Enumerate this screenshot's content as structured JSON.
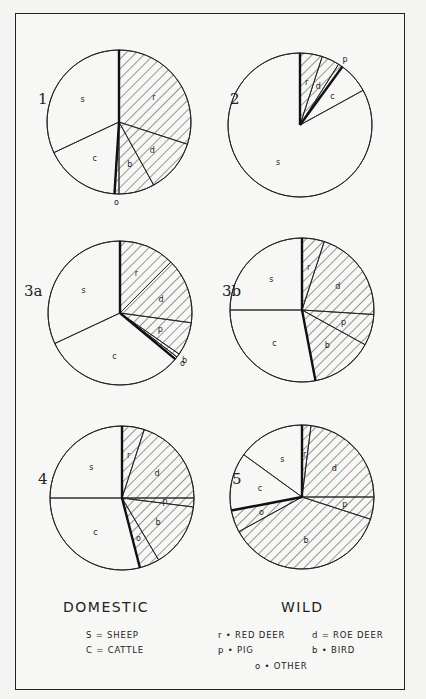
{
  "colors": {
    "ink": "#222222",
    "paper": "#f7f7f5",
    "hatch": "#333333"
  },
  "legend": {
    "domestic_title": "DOMESTIC",
    "wild_title": "WILD",
    "domestic_items": [
      {
        "key": "S",
        "sep": "=",
        "label": "SHEEP"
      },
      {
        "key": "C",
        "sep": "=",
        "label": "CATTLE"
      }
    ],
    "wild_items": [
      {
        "key": "r",
        "sep": "•",
        "label": "RED DEER"
      },
      {
        "key": "d",
        "sep": "=",
        "label": "ROE DEER"
      },
      {
        "key": "p",
        "sep": "•",
        "label": "PIG"
      },
      {
        "key": "b",
        "sep": "•",
        "label": "BIRD"
      },
      {
        "key": "o",
        "sep": "•",
        "label": "OTHER"
      }
    ],
    "lines": {
      "sheep": "S = SHEEP",
      "cattle": "C = CATTLE",
      "red_deer": "r • RED DEER",
      "roe_deer": "d = ROE DEER",
      "pig": "p • PIG",
      "bird": "b • BIRD",
      "other": "o • OTHER"
    }
  },
  "chart_data": [
    {
      "type": "pie",
      "title": "1",
      "categories": [
        "r",
        "d",
        "b",
        "o",
        "c",
        "s"
      ],
      "values": [
        30,
        12,
        8,
        1,
        17,
        32
      ],
      "wild": [
        true,
        true,
        true,
        true,
        false,
        false
      ],
      "start_angle": "12 o'clock, clockwise"
    },
    {
      "type": "pie",
      "title": "2",
      "categories": [
        "r",
        "d",
        "p",
        "c",
        "s"
      ],
      "values": [
        5,
        4,
        1,
        7,
        83
      ],
      "wild": [
        true,
        true,
        true,
        false,
        false
      ],
      "start_angle": "12 o'clock, clockwise"
    },
    {
      "type": "pie",
      "title": "3a",
      "categories": [
        "r",
        "d",
        "p",
        "b",
        "o",
        "c",
        "s"
      ],
      "values": [
        12.5,
        14.7,
        7.5,
        0.8,
        0.6,
        32,
        32
      ],
      "wild": [
        true,
        true,
        true,
        true,
        true,
        false,
        false
      ],
      "start_angle": "12 o'clock, clockwise"
    },
    {
      "type": "pie",
      "title": "3b",
      "categories": [
        "r",
        "d",
        "p",
        "b",
        "c",
        "s"
      ],
      "values": [
        5,
        21,
        7,
        14,
        28,
        25
      ],
      "wild": [
        true,
        true,
        true,
        true,
        false,
        false
      ],
      "start_angle": "12 o'clock, clockwise"
    },
    {
      "type": "pie",
      "title": "4",
      "categories": [
        "r",
        "d",
        "p",
        "b",
        "o",
        "c",
        "s"
      ],
      "values": [
        5,
        20,
        2,
        14.5,
        4.5,
        29,
        25
      ],
      "wild": [
        true,
        true,
        true,
        true,
        true,
        false,
        false
      ],
      "start_angle": "12 o'clock, clockwise"
    },
    {
      "type": "pie",
      "title": "5",
      "categories": [
        "r",
        "d",
        "p",
        "b",
        "o",
        "c",
        "s"
      ],
      "values": [
        2,
        23,
        5,
        37,
        5,
        13,
        15
      ],
      "wild": [
        true,
        true,
        true,
        true,
        true,
        false,
        false
      ],
      "start_angle": "12 o'clock, clockwise"
    }
  ]
}
